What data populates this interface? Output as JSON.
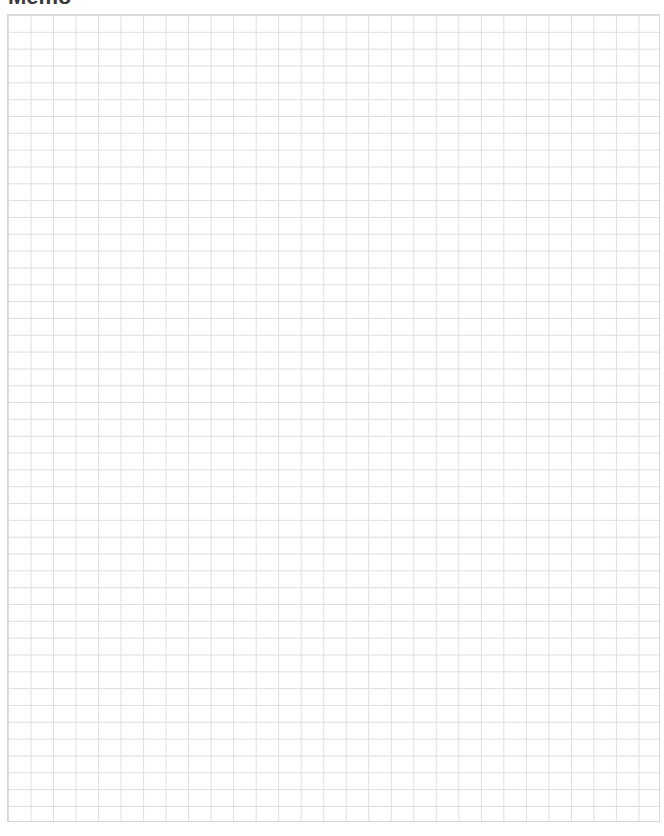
{
  "page": {
    "title": "Memo"
  },
  "grid": {
    "columns": 29,
    "rows": 48,
    "line_color": "#dedede",
    "border_color": "#d6d6d6"
  }
}
